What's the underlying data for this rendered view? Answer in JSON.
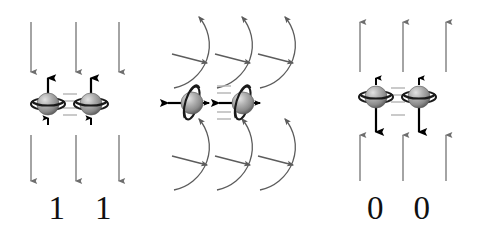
{
  "figure": {
    "background_color": "#ffffff",
    "panels": [
      {
        "id": "left",
        "name": "spin-up-panel",
        "field_direction": "down",
        "field_arrow_count_top": 3,
        "field_arrow_count_bottom": 3,
        "field_color": "#6e6e6e",
        "particle_count": 2,
        "particle_spin_arrow_direction": "up",
        "particle_ring_orientation": "horizontal",
        "coupling_dashes": 4,
        "coupling_color": "#b9b9b9",
        "labels": [
          "1",
          "1"
        ],
        "label_color": "#101010"
      },
      {
        "id": "middle",
        "name": "radiating-wave-panel",
        "field_direction": "none",
        "wave_rows": 2,
        "waves_per_row": 3,
        "wave_arc_color": "#5c5c5c",
        "wave_travel_arrow_direction": "right",
        "wave_arc_tip_arrow_direction": "up-left",
        "particle_count": 2,
        "particle_spin_arrow_direction": "left",
        "particle_ring_orientation": "vertical",
        "coupling_dashes": 4,
        "coupling_color": "#b9b9b9",
        "labels": [],
        "label_color": "#101010"
      },
      {
        "id": "right",
        "name": "spin-down-panel",
        "field_direction": "up",
        "field_arrow_count_top": 3,
        "field_arrow_count_bottom": 3,
        "field_color": "#6e6e6e",
        "particle_count": 2,
        "particle_spin_arrow_direction": "down",
        "particle_ring_orientation": "horizontal",
        "coupling_dashes": 4,
        "coupling_color": "#b9b9b9",
        "labels": [
          "0",
          "0"
        ],
        "label_color": "#101010"
      }
    ],
    "sphere": {
      "fill_light": "#d8d8d8",
      "fill_mid": "#9a9a9a",
      "fill_dark": "#6a6a6a",
      "ring_color": "#1a1a1a",
      "arrow_color": "#000000",
      "radius_px": 11
    }
  }
}
